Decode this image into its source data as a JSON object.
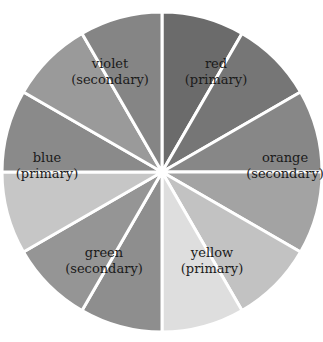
{
  "diagram": {
    "type": "color-wheel",
    "center": [
      162,
      172
    ],
    "radius": 160,
    "segments": [
      {
        "start": 0,
        "end": 30,
        "fill": "#6b6b6b"
      },
      {
        "start": 30,
        "end": 60,
        "fill": "#767676"
      },
      {
        "start": 60,
        "end": 90,
        "fill": "#878787"
      },
      {
        "start": 90,
        "end": 120,
        "fill": "#a3a3a3"
      },
      {
        "start": 120,
        "end": 150,
        "fill": "#c2c2c2"
      },
      {
        "start": 150,
        "end": 180,
        "fill": "#dedede"
      },
      {
        "start": 180,
        "end": 210,
        "fill": "#8e8e8e"
      },
      {
        "start": 210,
        "end": 240,
        "fill": "#959595"
      },
      {
        "start": 240,
        "end": 270,
        "fill": "#c6c6c6"
      },
      {
        "start": 270,
        "end": 300,
        "fill": "#8a8a8a"
      },
      {
        "start": 300,
        "end": 330,
        "fill": "#9a9a9a"
      },
      {
        "start": 330,
        "end": 360,
        "fill": "#858585"
      }
    ],
    "labels": [
      {
        "name": "violet",
        "role": "(secondary)",
        "x": 110,
        "y": 68
      },
      {
        "name": "red",
        "role": "(primary)",
        "x": 216,
        "y": 68
      },
      {
        "name": "orange",
        "role": "(secondary)",
        "x": 285,
        "y": 162
      },
      {
        "name": "blue",
        "role": "(primary)",
        "x": 47,
        "y": 162
      },
      {
        "name": "green",
        "role": "(secondary)",
        "x": 104,
        "y": 257
      },
      {
        "name": "yellow",
        "role": "(primary)",
        "x": 212,
        "y": 257
      }
    ]
  }
}
